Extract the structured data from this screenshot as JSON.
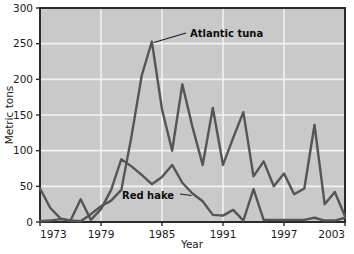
{
  "chart_data": {
    "type": "line",
    "title": "",
    "xlabel": "Year",
    "ylabel": "Metric tons",
    "xlim": [
      1973,
      2003
    ],
    "ylim": [
      0,
      300
    ],
    "grid": true,
    "legend_position": "inline-annotations",
    "x_ticks": [
      "1973",
      "1979",
      "1985",
      "1991",
      "1997",
      "2003"
    ],
    "x_tick_values": [
      1973,
      1979,
      1985,
      1991,
      1997,
      2003
    ],
    "y_ticks": [
      "0",
      "50",
      "100",
      "150",
      "200",
      "250",
      "300"
    ],
    "y_tick_values": [
      0,
      50,
      100,
      150,
      200,
      250,
      300
    ],
    "x": [
      1973,
      1974,
      1975,
      1976,
      1977,
      1978,
      1979,
      1980,
      1981,
      1982,
      1983,
      1984,
      1985,
      1986,
      1987,
      1988,
      1989,
      1990,
      1991,
      1992,
      1993,
      1994,
      1995,
      1996,
      1997,
      1998,
      1999,
      2000,
      2001,
      2002,
      2003
    ],
    "series": [
      {
        "name": "Atlantic tuna",
        "color": "#555555",
        "values": [
          1,
          2,
          4,
          2,
          1,
          11,
          22,
          30,
          45,
          120,
          205,
          253,
          158,
          100,
          193,
          133,
          80,
          160,
          80,
          118,
          154,
          64,
          85,
          50,
          68,
          39,
          47,
          136,
          25,
          42,
          8
        ]
      },
      {
        "name": "Red hake",
        "color": "#555555",
        "values": [
          47,
          20,
          5,
          2,
          32,
          3,
          18,
          45,
          88,
          78,
          66,
          53,
          63,
          80,
          55,
          40,
          29,
          10,
          9,
          17,
          2,
          46,
          3,
          3,
          3,
          3,
          3,
          6,
          2,
          2,
          6
        ]
      }
    ],
    "annotations": [
      {
        "label": "Atlantic tuna",
        "points_to_year": 1984,
        "points_to_value": 253
      },
      {
        "label": "Red hake",
        "points_to_year": 1988,
        "points_to_value": 40
      }
    ]
  },
  "colors": {
    "plot_background": "#c9c9c9",
    "gridline": "#f2f2f2",
    "axis": "#2b2b2b",
    "line": "#555555",
    "text": "#1a1a1a",
    "page_background": "#ffffff"
  }
}
